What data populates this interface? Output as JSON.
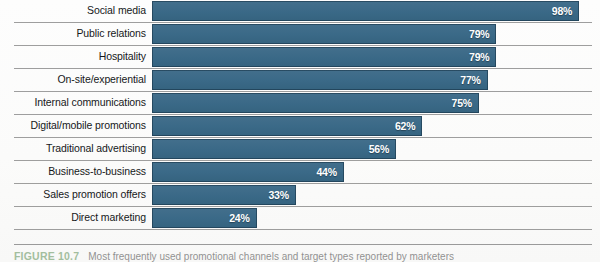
{
  "figure": {
    "tag": "FIGURE 10.7",
    "caption": "Most frequently used promotional channels and target types reported by marketers"
  },
  "colors": {
    "bar": "#3c6c8a",
    "bar_border": "#143041",
    "value_text": "#ffffff",
    "label_text": "#16181a",
    "separator": "#8d8d8d",
    "caption_tag": "#5d8f55",
    "background": "#fdfdfd"
  },
  "chart_data": {
    "type": "bar",
    "orientation": "horizontal",
    "title": "",
    "subtitle": "",
    "xlabel": "",
    "ylabel": "",
    "xlim": [
      0,
      100
    ],
    "grid": false,
    "legend": "none",
    "value_suffix": "%",
    "categories": [
      "Social media",
      "Public relations",
      "Hospitality",
      "On-site/experiential",
      "Internal communications",
      "Digital/mobile promotions",
      "Traditional advertising",
      "Business-to-business",
      "Sales promotion offers",
      "Direct marketing"
    ],
    "values": [
      98,
      79,
      79,
      77,
      75,
      62,
      56,
      44,
      33,
      24
    ],
    "value_labels": [
      "98%",
      "79%",
      "79%",
      "77%",
      "75%",
      "62%",
      "56%",
      "44%",
      "33%",
      "24%"
    ]
  }
}
